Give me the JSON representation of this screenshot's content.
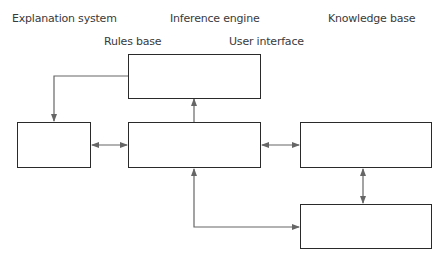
{
  "diagram": {
    "labels": {
      "explanation_system": "Explanation system",
      "inference_engine": "Inference engine",
      "knowledge_base": "Knowledge base",
      "rules_base": "Rules base",
      "user_interface": "User interface"
    },
    "boxes": [
      {
        "id": "top-box",
        "text": ""
      },
      {
        "id": "left-box",
        "text": ""
      },
      {
        "id": "center-box",
        "text": ""
      },
      {
        "id": "right-upper-box",
        "text": ""
      },
      {
        "id": "right-lower-box",
        "text": ""
      }
    ],
    "connections": [
      {
        "from": "top-box",
        "to": "left-box",
        "type": "one-way"
      },
      {
        "from": "center-box",
        "to": "top-box",
        "type": "one-way"
      },
      {
        "from": "left-box",
        "to": "center-box",
        "type": "two-way"
      },
      {
        "from": "center-box",
        "to": "right-upper-box",
        "type": "two-way"
      },
      {
        "from": "right-upper-box",
        "to": "right-lower-box",
        "type": "two-way"
      },
      {
        "from": "center-box",
        "to": "right-lower-box",
        "type": "two-way-elbow"
      }
    ],
    "colors": {
      "box_border": "#2a2a2a",
      "arrow": "#666666",
      "text": "#3a3a3a"
    }
  }
}
